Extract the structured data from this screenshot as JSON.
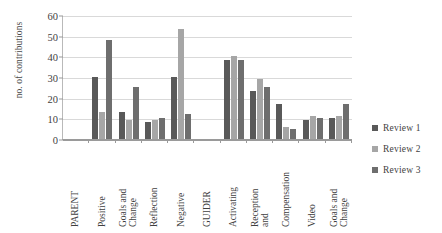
{
  "chart_data": {
    "type": "bar",
    "title": "",
    "xlabel": "",
    "ylabel": "no. of contributions",
    "ylim": [
      0,
      60
    ],
    "yticks": [
      0,
      10,
      20,
      30,
      40,
      50,
      60
    ],
    "grid": true,
    "legend_position": "right",
    "categories": [
      "PARENT",
      "Positive",
      "Goals and Change",
      "Reflection",
      "Negative",
      "GUIDER",
      "Activating",
      "Reception and Compensation",
      "Compensation",
      "Video",
      "Goals and Change"
    ],
    "category_labels": [
      "PARENT",
      "Positive",
      "Goals and\nChange",
      "Reflection",
      "Negative",
      "GUIDER",
      "Activating",
      "Reception\nand",
      "Compensation",
      "Video",
      "Goals and\nChange"
    ],
    "series": [
      {
        "name": "Review 1",
        "color": "#595959",
        "values": [
          null,
          30,
          13,
          8,
          30,
          null,
          38,
          23,
          17,
          9,
          10
        ]
      },
      {
        "name": "Review 2",
        "color": "#a6a6a6",
        "values": [
          null,
          13,
          9,
          9,
          53,
          null,
          40,
          29,
          6,
          11,
          11
        ]
      },
      {
        "name": "Review 3",
        "color": "#6e6e6e",
        "values": [
          null,
          48,
          25,
          10,
          12,
          null,
          38,
          25,
          5,
          10,
          17
        ]
      }
    ]
  },
  "legend": {
    "items": [
      {
        "label": "Review 1",
        "color": "#595959"
      },
      {
        "label": "Review 2",
        "color": "#a6a6a6"
      },
      {
        "label": "Review 3",
        "color": "#6e6e6e"
      }
    ]
  }
}
